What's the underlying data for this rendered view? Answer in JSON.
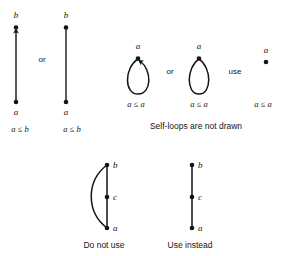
{
  "figure": {
    "background_color": "#ffffff",
    "ink_color": "#141414",
    "sections": [
      {
        "id": "covering-relation",
        "diagrams": [
          {
            "id": "arrow-version",
            "nodes": [
              {
                "name": "top-node",
                "label": "b"
              },
              {
                "name": "bottom-node",
                "label": "a"
              }
            ],
            "edge": {
              "type": "straight",
              "arrowhead": "up"
            },
            "relation_label": "a ≤ b"
          },
          {
            "id": "plain-version",
            "nodes": [
              {
                "name": "top-node",
                "label": "b"
              },
              {
                "name": "bottom-node",
                "label": "a"
              }
            ],
            "edge": {
              "type": "straight",
              "arrowhead": "none"
            },
            "relation_label": "a ≤ b"
          }
        ],
        "connector": "or"
      },
      {
        "id": "self-loops",
        "caption": "Self-loops are not drawn",
        "diagrams": [
          {
            "id": "loop-with-arrow",
            "node_label": "a",
            "loop": true,
            "arrowhead": true,
            "relation_label": "a ≤ a"
          },
          {
            "id": "loop-plain",
            "node_label": "a",
            "loop": true,
            "arrowhead": false,
            "relation_label": "a ≤ a"
          },
          {
            "id": "point-only",
            "node_label": "a",
            "loop": false,
            "arrowhead": false,
            "relation_label": "a ≤ a"
          }
        ],
        "connector_1": "or",
        "connector_2": "use"
      },
      {
        "id": "transitivity",
        "diagrams": [
          {
            "id": "redundant-edge",
            "caption": "Do not use",
            "nodes": [
              {
                "name": "top-node",
                "label": "b"
              },
              {
                "name": "middle-node",
                "label": "c"
              },
              {
                "name": "bottom-node",
                "label": "a"
              }
            ],
            "has_transitive_arc": true
          },
          {
            "id": "reduced-edge",
            "caption": "Use instead",
            "nodes": [
              {
                "name": "top-node",
                "label": "b"
              },
              {
                "name": "middle-node",
                "label": "c"
              },
              {
                "name": "bottom-node",
                "label": "a"
              }
            ],
            "has_transitive_arc": false
          }
        ]
      }
    ]
  }
}
